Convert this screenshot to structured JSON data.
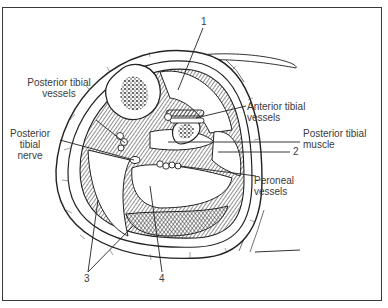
{
  "figure": {
    "labels": {
      "posterior_tibial_vessels": [
        "Posterior tibial",
        "vessels"
      ],
      "posterior_tibial_nerve": [
        "Posterior",
        "tibial",
        "nerve"
      ],
      "anterior_tibial_vessels": [
        "Anterior tibial",
        "vessels"
      ],
      "posterior_tibial_muscle": [
        "Posterior tibial",
        "muscle"
      ],
      "peroneal_vessels": [
        "Peroneal",
        "vessels"
      ]
    },
    "numbers": {
      "n1": "1",
      "n2": "2",
      "n3": "3",
      "n4": "4"
    },
    "colors": {
      "ink": "#2a2a2a",
      "frame": "#3a3a3a",
      "background": "#ffffff"
    }
  }
}
